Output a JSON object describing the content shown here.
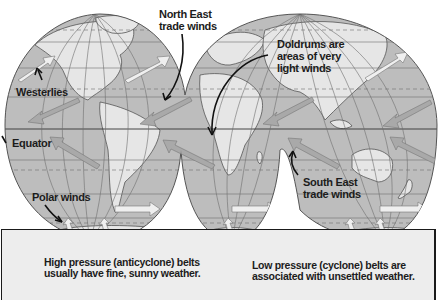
{
  "diagram": {
    "type": "interrupted world map of global wind belts",
    "colors": {
      "ocean": "#bdbdbd",
      "land": "#e8e8e8",
      "grid": "#6e6e6e",
      "outline": "#555555",
      "high_pressure_arrow": "#a9a9a9",
      "low_pressure_arrow": "#e4e4e4",
      "pointer": "#111111",
      "legend_bg": "#ededed"
    },
    "labels": {
      "ne_trade_line1": "North East",
      "ne_trade_line2": "trade winds",
      "doldrums_line1": "Doldrums are",
      "doldrums_line2": "areas of very",
      "doldrums_line3": "light winds",
      "westerlies": "Westerlies",
      "equator": "Equator",
      "polar_winds": "Polar winds",
      "se_trade_line1": "South East",
      "se_trade_line2": "trade winds"
    }
  },
  "legend": {
    "high": {
      "line1": "High pressure (anticyclone) belts",
      "line2": "usually have fine, sunny weather."
    },
    "low": {
      "line1": "Low pressure (cyclone) belts are",
      "line2": "associated with unsettled weather."
    }
  }
}
